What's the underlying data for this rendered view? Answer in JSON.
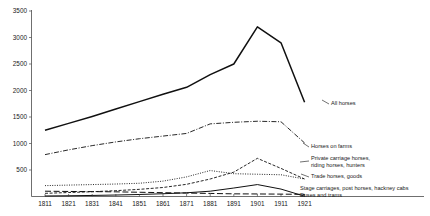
{
  "chart_data": {
    "type": "line",
    "title": "",
    "subtitle": "",
    "xlabel": "",
    "ylabel": "",
    "xlim": [
      1811,
      1931
    ],
    "ylim": [
      0,
      3500
    ],
    "grid": false,
    "legend_position": "right-inline-labels",
    "x": [
      1811,
      1821,
      1831,
      1841,
      1851,
      1861,
      1871,
      1881,
      1891,
      1901,
      1911,
      1921
    ],
    "xtick_labels": [
      "1811",
      "1821",
      "1831",
      "1841",
      "1851",
      "1861",
      "1871",
      "1881",
      "1891",
      "1901",
      "1911",
      "1921"
    ],
    "ytick_labels": [
      "500",
      "1000",
      "1500",
      "2000",
      "2500",
      "3000",
      "3500"
    ],
    "yticks": [
      500,
      1000,
      1500,
      2000,
      2500,
      3000,
      3500
    ],
    "series": [
      {
        "name": "All horses",
        "label": "All horses",
        "style": "solid",
        "width": 1.5,
        "values": [
          1250,
          1380,
          1510,
          1650,
          1790,
          1930,
          2060,
          2300,
          2500,
          3200,
          2900,
          1780
        ]
      },
      {
        "name": "Horses on farms",
        "label": "Horses on farms",
        "style": "dash-dot",
        "width": 0.9,
        "values": [
          790,
          880,
          960,
          1030,
          1090,
          1140,
          1190,
          1370,
          1400,
          1420,
          1410,
          1010
        ]
      },
      {
        "name": "Private carriage horses, riding horses, hunters",
        "label_line1": "Private carriage horses,",
        "label_line2": "riding horses, hunters",
        "style": "dashed",
        "width": 0.9,
        "values": [
          60,
          75,
          90,
          110,
          135,
          170,
          230,
          330,
          460,
          720,
          530,
          330
        ]
      },
      {
        "name": "Trade horses, goods",
        "label": "Trade horses, goods",
        "style": "dotted",
        "width": 0.9,
        "values": [
          205,
          215,
          225,
          235,
          250,
          290,
          370,
          490,
          430,
          420,
          410,
          330
        ]
      },
      {
        "name": "Stage carriages, post horses, hackney cabs",
        "label": "Stage carriages, post horses, hackney cabs",
        "style": "long-dash",
        "width": 1.0,
        "values": [
          100,
          95,
          92,
          88,
          80,
          72,
          65,
          58,
          50,
          48,
          45,
          40
        ]
      },
      {
        "name": "Buses and trams",
        "label": "Buses and trams",
        "style": "solid",
        "width": 1.0,
        "values": [
          10,
          14,
          20,
          28,
          38,
          52,
          70,
          100,
          160,
          225,
          140,
          5
        ]
      }
    ]
  },
  "axes": {
    "y_axis_name": "y-axis",
    "x_axis_name": "x-axis"
  }
}
